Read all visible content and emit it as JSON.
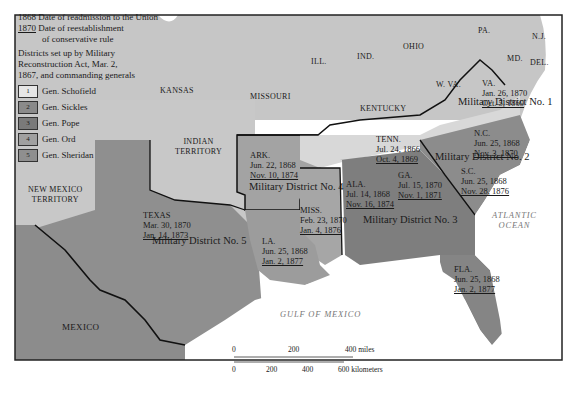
{
  "legend": {
    "readmission_year": "1868",
    "readmission_text": "Date of readmission to the Union",
    "conservative_year": "1870",
    "conservative_text_1": "Date of reestablishment",
    "conservative_text_2": "of conservative rule",
    "districts_text_1": "Districts set up by Military",
    "districts_text_2": "Reconstruction Act, Mar. 2,",
    "districts_text_3": "1867, and commanding generals",
    "items": [
      {
        "num": "1",
        "general": "Gen. Schofield",
        "color": "#dcdcdc"
      },
      {
        "num": "2",
        "general": "Gen. Sickles",
        "color": "#8a8a8a"
      },
      {
        "num": "3",
        "general": "Gen. Pope",
        "color": "#7a7a7a"
      },
      {
        "num": "4",
        "general": "Gen. Ord",
        "color": "#a0a0a0"
      },
      {
        "num": "5",
        "general": "Gen. Sheridan",
        "color": "#8f8f8f"
      }
    ]
  },
  "regions": {
    "kansas": "KANSAS",
    "missouri": "MISSOURI",
    "ill": "ILL.",
    "ind": "IND.",
    "ohio": "OHIO",
    "pa": "PA.",
    "nj": "N.J.",
    "md": "MD.",
    "del": "DEL.",
    "wva": "W. VA.",
    "kentucky": "KENTUCKY",
    "indian_territory_1": "INDIAN",
    "indian_territory_2": "TERRITORY",
    "new_mexico_1": "NEW MEXICO",
    "new_mexico_2": "TERRITORY",
    "mexico": "MEXICO"
  },
  "states": {
    "va": {
      "name": "VA.",
      "readmitted": "Jan. 26, 1870",
      "conservative": "Oct. 5, 1869"
    },
    "tenn": {
      "name": "TENN.",
      "readmitted": "Jul. 24, 1866",
      "conservative": "Oct. 4, 1869"
    },
    "nc": {
      "name": "N.C.",
      "readmitted": "Jun. 25, 1868",
      "conservative": "Nov. 3, 1870"
    },
    "sc": {
      "name": "S.C.",
      "readmitted": "Jun. 25, 1868",
      "conservative": "Nov. 28, 1876"
    },
    "ga": {
      "name": "GA.",
      "readmitted": "Jul. 15, 1870",
      "conservative": "Nov. 1, 1871"
    },
    "ala": {
      "name": "ALA.",
      "readmitted": "Jul. 14, 1868",
      "conservative": "Nov. 16, 1874"
    },
    "miss": {
      "name": "MISS.",
      "readmitted": "Feb. 23, 1870",
      "conservative": "Jan. 4, 1876"
    },
    "ark": {
      "name": "ARK.",
      "readmitted": "Jun. 22, 1868",
      "conservative": "Nov. 10, 1874"
    },
    "la": {
      "name": "LA.",
      "readmitted": "Jun. 25, 1868",
      "conservative": "Jan. 2, 1877"
    },
    "texas": {
      "name": "TEXAS",
      "readmitted": "Mar. 30, 1870",
      "conservative": "Jan. 14, 1873"
    },
    "fla": {
      "name": "FLA.",
      "readmitted": "Jun. 25, 1868",
      "conservative": "Jan. 2, 1877"
    }
  },
  "districts": {
    "d1": "Military District No. 1",
    "d2": "Military District No. 2",
    "d3": "Military District No. 3",
    "d4": "Military District No. 4",
    "d5": "Military District No. 5"
  },
  "water": {
    "atlantic_1": "ATLANTIC",
    "atlantic_2": "OCEAN",
    "gulf": "GULF OF MEXICO"
  },
  "scale": {
    "miles": [
      "0",
      "200",
      "400 miles"
    ],
    "km": [
      "0",
      "200",
      "400",
      "600 kilometers"
    ]
  },
  "colors": {
    "non_south": "#c8c8c8",
    "district1": "#d4d4d4",
    "district2": "#8c8c8c",
    "district3": "#7e7e7e",
    "district4": "#a3a3a3",
    "district5": "#909090",
    "mexico": "#8e8e8e",
    "water": "#ffffff"
  }
}
